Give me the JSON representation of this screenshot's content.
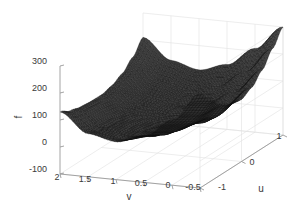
{
  "figure": {
    "type": "surface-plot-3d",
    "background_color": "#ffffff",
    "axis_color": "#9a9a9a",
    "grid_color": "#e0e0e0",
    "text_color": "#3a3a3a",
    "surface_color": "#3a3a3a",
    "mesh_color": "#1a1a1a"
  },
  "chart_data": {
    "type": "surface",
    "title": "",
    "xlabel": "v",
    "ylabel": "u",
    "zlabel": "f",
    "xlim": [
      -0.5,
      2
    ],
    "ylim": [
      -1,
      1
    ],
    "zlim": [
      -100,
      300
    ],
    "grid": true,
    "legend": "none",
    "x_ticks": [
      "2",
      "1.5",
      "1",
      "0.5",
      "0",
      "-0.5"
    ],
    "x_tick_values": [
      2,
      1.5,
      1,
      0.5,
      0,
      -0.5
    ],
    "y_ticks": [
      "-1",
      "0",
      "1"
    ],
    "y_tick_values": [
      -1,
      0,
      1
    ],
    "z_ticks": [
      "-100",
      "0",
      "100",
      "200",
      "300"
    ],
    "z_tick_values": [
      -100,
      0,
      100,
      200,
      300
    ],
    "view": {
      "azimuth": -37.5,
      "elevation": 30
    },
    "surface_samples": {
      "u": [
        -1,
        -0.75,
        -0.5,
        -0.25,
        0,
        0.25,
        0.5,
        0.75,
        1
      ],
      "v": [
        -0.5,
        0,
        0.5,
        1,
        1.5,
        2
      ],
      "f": [
        [
          250,
          140,
          70,
          40,
          60,
          130
        ],
        [
          200,
          105,
          48,
          28,
          48,
          110
        ],
        [
          160,
          78,
          30,
          18,
          40,
          100
        ],
        [
          135,
          60,
          20,
          12,
          36,
          96
        ],
        [
          130,
          55,
          16,
          10,
          35,
          95
        ],
        [
          150,
          70,
          24,
          16,
          42,
          105
        ],
        [
          190,
          100,
          45,
          32,
          58,
          125
        ],
        [
          245,
          148,
          82,
          62,
          88,
          160
        ],
        [
          300,
          210,
          140,
          110,
          135,
          210
        ]
      ]
    }
  },
  "axes": {
    "z": {
      "label": "f",
      "ticks": [
        {
          "text": "300",
          "x": 47,
          "y": 61,
          "tx": 54,
          "ty": 61
        },
        {
          "text": "200",
          "x": 47,
          "y": 88,
          "tx": 54,
          "ty": 88
        },
        {
          "text": "100",
          "x": 47,
          "y": 115,
          "tx": 54,
          "ty": 115
        },
        {
          "text": "0",
          "x": 47,
          "y": 142,
          "tx": 54,
          "ty": 142
        },
        {
          "text": "-100",
          "x": 47,
          "y": 169,
          "tx": 54,
          "ty": 169
        }
      ]
    },
    "v": {
      "label": "v",
      "ticks": [
        {
          "text": "2",
          "x": 57,
          "y": 180
        },
        {
          "text": "1.5",
          "x": 85,
          "y": 182
        },
        {
          "text": "1",
          "x": 113,
          "y": 184
        },
        {
          "text": "0.5",
          "x": 141,
          "y": 186
        },
        {
          "text": "0",
          "x": 168,
          "y": 188
        },
        {
          "text": "-0.5",
          "x": 193,
          "y": 190
        }
      ]
    },
    "u": {
      "label": "u",
      "ticks": [
        {
          "text": "-1",
          "x": 222,
          "y": 190
        },
        {
          "text": "0",
          "x": 252,
          "y": 165
        },
        {
          "text": "1",
          "x": 279,
          "y": 139
        }
      ]
    }
  }
}
